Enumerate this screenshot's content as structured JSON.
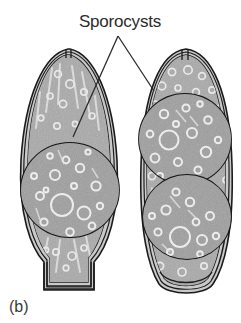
{
  "figure": {
    "caption": "(b)",
    "label": "Sporocysts",
    "colors": {
      "background": "#ffffff",
      "outline": "#1a1a1a",
      "wall_fill": "#c6c6c6",
      "cytoplasm_fill": "#a8a8a8",
      "sporocyst_fill": "#9a9a9a",
      "vacuole": "#e4e4e4",
      "label_color": "#2b2b2b",
      "leader_color": "#2b2b2b"
    },
    "leaders": [
      {
        "name": "leader-left",
        "from_x": 118,
        "from_y": 36,
        "to_x": 73,
        "to_y": 137
      },
      {
        "name": "leader-right",
        "from_x": 118,
        "from_y": 36,
        "to_x": 154,
        "to_y": 91
      }
    ],
    "oocysts": [
      {
        "name": "oocyst-left",
        "sporocyst_count": 1,
        "bounds": {
          "x": 16,
          "y": 48,
          "width": 102,
          "height": 244
        },
        "apex": "pointed-with-micropyle-slit",
        "base": "flared-trapezoidal-stalk",
        "sporocysts": [
          {
            "name": "sporocyst-left-1",
            "cx": 70,
            "cy": 190,
            "rx": 49,
            "ry": 47
          }
        ]
      },
      {
        "name": "oocyst-right",
        "sporocyst_count": 2,
        "bounds": {
          "x": 138,
          "y": 48,
          "width": 96,
          "height": 247
        },
        "apex": "rounded-with-micropyle-slit",
        "base": "rounded-tapered",
        "sporocysts": [
          {
            "name": "sporocyst-right-upper",
            "cx": 185,
            "cy": 139,
            "rx": 46,
            "ry": 45
          },
          {
            "name": "sporocyst-right-lower",
            "cx": 187,
            "cy": 217,
            "rx": 44,
            "ry": 42
          }
        ]
      }
    ]
  }
}
